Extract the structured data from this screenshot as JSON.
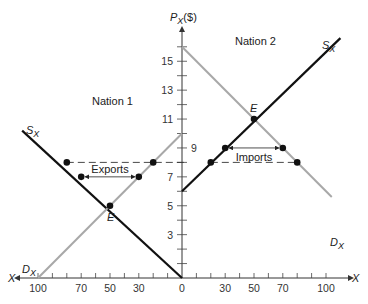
{
  "chart_data": {
    "type": "line",
    "title": "",
    "y_axis_label": "P_X($)",
    "x_axis_label_left": "X",
    "x_axis_label_right": "X",
    "y_ticks": [
      1,
      3,
      5,
      7,
      9,
      11,
      13,
      15
    ],
    "y_tick_labels": [
      "3",
      "5",
      "7",
      "9",
      "11",
      "13",
      "15"
    ],
    "x_ticks_left_labels": [
      "100",
      "70",
      "50",
      "30",
      "0"
    ],
    "x_ticks_right_labels": [
      "30",
      "50",
      "70",
      "100"
    ],
    "ylim": [
      0,
      17
    ],
    "xlim_left": [
      0,
      110
    ],
    "xlim_right": [
      0,
      110
    ],
    "panels": [
      {
        "name": "Nation 1",
        "side": "left",
        "series": [
          {
            "name": "S_X",
            "color": "#111111",
            "points": [
              [
                0,
                0
              ],
              [
                111,
                10.2
              ]
            ]
          },
          {
            "name": "D_X",
            "color": "#a8a8a8",
            "points": [
              [
                100,
                0
              ],
              [
                0,
                10
              ]
            ]
          }
        ],
        "equilibrium": {
          "label": "E",
          "x": 50,
          "p": 5
        },
        "trade": {
          "label": "Exports",
          "p": 7,
          "from_x": 70,
          "to_x": 30
        },
        "dashed_price": 8,
        "points": [
          [
            80,
            8
          ],
          [
            20,
            8
          ],
          [
            70,
            7
          ],
          [
            30,
            7
          ],
          [
            50,
            5
          ]
        ]
      },
      {
        "name": "Nation 2",
        "side": "right",
        "series": [
          {
            "name": "S_X",
            "color": "#111111",
            "points": [
              [
                0,
                6
              ],
              [
                110,
                16.6
              ]
            ]
          },
          {
            "name": "D_X",
            "color": "#a8a8a8",
            "points": [
              [
                0,
                16
              ],
              [
                104,
                5.6
              ]
            ]
          }
        ],
        "equilibrium": {
          "label": "E",
          "x": 50,
          "p": 11
        },
        "trade": {
          "label": "Imports",
          "p": 9,
          "from_x": 30,
          "to_x": 70
        },
        "dashed_price": 8,
        "points": [
          [
            20,
            8
          ],
          [
            80,
            8
          ],
          [
            30,
            9
          ],
          [
            70,
            9
          ],
          [
            50,
            11
          ]
        ]
      }
    ],
    "grid": false,
    "legend": "none"
  },
  "labels": {
    "nation1": "Nation 1",
    "nation2": "Nation 2",
    "y_axis": "P",
    "y_axis_sub": "X",
    "y_axis_unit": "($)",
    "x_left": "X",
    "x_right": "X",
    "sx": "S",
    "dx": "D",
    "sub_x": "X",
    "eq": "E",
    "exports": "Exports",
    "imports": "Imports"
  }
}
